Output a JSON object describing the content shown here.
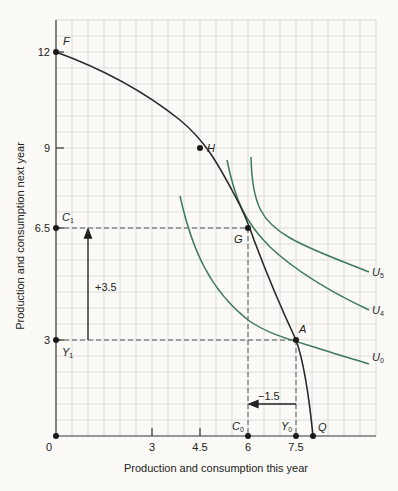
{
  "chart_data": {
    "type": "line",
    "title": "",
    "xlabel": "Production and consumption this year",
    "ylabel": "Production and consumption next year",
    "xlim": [
      0,
      10
    ],
    "ylim": [
      0,
      13
    ],
    "grid": true,
    "grid_step": 0.5,
    "x_ticks": [
      {
        "value": 0,
        "label": "0"
      },
      {
        "value": 3,
        "label": "3"
      },
      {
        "value": 4.5,
        "label": "4.5"
      },
      {
        "value": 6,
        "label": "6"
      },
      {
        "value": 7.5,
        "label": "7.5"
      }
    ],
    "y_ticks": [
      {
        "value": 12,
        "label": "12"
      },
      {
        "value": 9,
        "label": "9"
      },
      {
        "value": 6.5,
        "label": "6.5"
      },
      {
        "value": 3,
        "label": "3"
      }
    ],
    "series": [
      {
        "name": "Production possibility frontier FQ",
        "color": "#2a2a2a",
        "points": [
          [
            0,
            12
          ],
          [
            1,
            11.6
          ],
          [
            2,
            11.05
          ],
          [
            3,
            10.2
          ],
          [
            4,
            9.4
          ],
          [
            4.5,
            9
          ],
          [
            5,
            8.3
          ],
          [
            5.5,
            7.5
          ],
          [
            6,
            6.5
          ],
          [
            6.5,
            5.4
          ],
          [
            7,
            4.25
          ],
          [
            7.5,
            3
          ],
          [
            7.8,
            1.8
          ],
          [
            8,
            0
          ]
        ]
      },
      {
        "name": "U5",
        "color": "#3d7a5c",
        "points": [
          [
            6.1,
            8.8
          ],
          [
            6.3,
            7.6
          ],
          [
            6.7,
            6.8
          ],
          [
            7.3,
            6.2
          ],
          [
            8,
            5.7
          ],
          [
            8.7,
            5.2
          ]
        ]
      },
      {
        "name": "U4",
        "color": "#3d7a5c",
        "points": [
          [
            5.4,
            8.6
          ],
          [
            5.7,
            7.3
          ],
          [
            6.2,
            6.2
          ],
          [
            6.9,
            5.4
          ],
          [
            7.7,
            4.6
          ],
          [
            8.7,
            3.9
          ]
        ]
      },
      {
        "name": "U0",
        "color": "#3d7a5c",
        "points": [
          [
            3.9,
            7.5
          ],
          [
            4.3,
            5.8
          ],
          [
            5,
            4.5
          ],
          [
            6,
            3.5
          ],
          [
            7.5,
            3
          ],
          [
            8.7,
            2.4
          ]
        ]
      }
    ],
    "points": [
      {
        "label": "F",
        "x": 0,
        "y": 12
      },
      {
        "label": "H",
        "x": 4.5,
        "y": 9
      },
      {
        "label": "G",
        "x": 6,
        "y": 6.5
      },
      {
        "label": "A",
        "x": 7.5,
        "y": 3
      },
      {
        "label": "Q",
        "x": 8,
        "y": 0
      },
      {
        "label": "C0",
        "x": 6,
        "y": 0
      },
      {
        "label": "Y0",
        "x": 7.5,
        "y": 0
      },
      {
        "label": "C1",
        "x": 0,
        "y": 6.5
      },
      {
        "label": "Y1",
        "x": 0,
        "y": 3
      },
      {
        "label": "0",
        "x": 0,
        "y": 0
      }
    ],
    "annotations": [
      {
        "text": "+3.5",
        "type": "arrow-up",
        "from": [
          1,
          3
        ],
        "to": [
          1,
          6.5
        ]
      },
      {
        "text": "−1.5",
        "type": "arrow-left",
        "from": [
          7.5,
          1.1
        ],
        "to": [
          6,
          1.1
        ]
      }
    ],
    "curve_labels": [
      {
        "text": "U5",
        "x": 8.9,
        "y": 5.2
      },
      {
        "text": "U4",
        "x": 8.9,
        "y": 3.9
      },
      {
        "text": "U0",
        "x": 8.9,
        "y": 2.4
      }
    ]
  },
  "labels": {
    "F": "F",
    "H": "H",
    "G": "G",
    "A": "A",
    "Q": "Q",
    "C": "C",
    "Y": "Y",
    "U": "U",
    "sub0": "0",
    "sub1": "1",
    "sub4": "4",
    "sub5": "5",
    "origin": "0",
    "plus": "+3.5",
    "minus": "−1.5"
  },
  "ticks": {
    "x3": "3",
    "x45": "4.5",
    "x6": "6",
    "x75": "7.5",
    "y12": "12",
    "y9": "9",
    "y65": "6.5",
    "y3": "3"
  },
  "axes": {
    "x_title": "Production and consumption this year",
    "y_title": "Production and consumption next year"
  }
}
